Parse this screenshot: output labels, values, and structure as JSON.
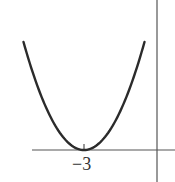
{
  "chart_data": {
    "type": "line",
    "title": "",
    "function": "y = (x + 3)^2",
    "xlabel": "",
    "ylabel": "",
    "x_tick_labels": [
      "−3"
    ],
    "x_ticks": [
      -3
    ],
    "vertex": {
      "x": -3,
      "y": 0
    },
    "x": [
      -6.3,
      -5,
      -4,
      -3,
      -2,
      -1,
      0.3
    ],
    "series": [
      {
        "name": "parabola",
        "values": [
          10.89,
          4,
          1,
          0,
          1,
          4,
          10.89
        ]
      }
    ],
    "grid": false,
    "legend": "none",
    "colors": {
      "curve": "#2b2b2b",
      "axes": "#555555"
    }
  },
  "labels": {
    "tick_neg3": "−3"
  }
}
